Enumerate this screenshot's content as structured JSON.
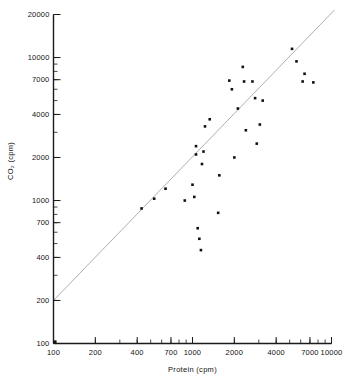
{
  "chart_data": {
    "type": "scatter",
    "title": "",
    "xlabel": "Protein (cpm)",
    "ylabel": "CO2 (cpm)",
    "ylabel_display": "CO₂ (cpm)",
    "xscale": "log",
    "yscale": "log",
    "xlim": [
      100,
      10000
    ],
    "ylim": [
      100,
      20000
    ],
    "grid": false,
    "legend": null,
    "xticks": [
      100,
      200,
      400,
      700,
      1000,
      2000,
      4000,
      7000,
      10000
    ],
    "xticklabels": [
      "100",
      "200",
      "400",
      "700",
      "1000",
      "2000",
      "4000",
      "7000",
      "10000"
    ],
    "yticks": [
      100,
      200,
      400,
      700,
      1000,
      2000,
      4000,
      7000,
      10000,
      20000
    ],
    "yticklabels": [
      "100",
      "200",
      "400",
      "700",
      "1000",
      "2000",
      "4000",
      "7000",
      "10000",
      "20000"
    ],
    "marker": "square",
    "marker_color": "#111111",
    "marker_size": 2.6,
    "fit_line": {
      "kind": "regression",
      "color": "#9b9b9b",
      "width": 0.8,
      "x_start": 100,
      "y_start": 200,
      "x_end": 10500,
      "y_end": 21500
    },
    "points": [
      {
        "x": 103,
        "y": 103
      },
      {
        "x": 430,
        "y": 880
      },
      {
        "x": 530,
        "y": 1030
      },
      {
        "x": 640,
        "y": 1210
      },
      {
        "x": 880,
        "y": 1000
      },
      {
        "x": 1000,
        "y": 1290
      },
      {
        "x": 1030,
        "y": 1060
      },
      {
        "x": 1060,
        "y": 2100
      },
      {
        "x": 1060,
        "y": 2400
      },
      {
        "x": 1090,
        "y": 640
      },
      {
        "x": 1120,
        "y": 540
      },
      {
        "x": 1150,
        "y": 450
      },
      {
        "x": 1170,
        "y": 1800
      },
      {
        "x": 1200,
        "y": 2200
      },
      {
        "x": 1230,
        "y": 3300
      },
      {
        "x": 1330,
        "y": 3700
      },
      {
        "x": 1530,
        "y": 820
      },
      {
        "x": 1560,
        "y": 1500
      },
      {
        "x": 1840,
        "y": 6900
      },
      {
        "x": 1920,
        "y": 6000
      },
      {
        "x": 2000,
        "y": 2000
      },
      {
        "x": 2120,
        "y": 4400
      },
      {
        "x": 2300,
        "y": 8600
      },
      {
        "x": 2350,
        "y": 6800
      },
      {
        "x": 2420,
        "y": 3100
      },
      {
        "x": 2700,
        "y": 6800
      },
      {
        "x": 2820,
        "y": 5200
      },
      {
        "x": 2900,
        "y": 2500
      },
      {
        "x": 3050,
        "y": 3400
      },
      {
        "x": 3200,
        "y": 5000
      },
      {
        "x": 5200,
        "y": 11500
      },
      {
        "x": 5600,
        "y": 9400
      },
      {
        "x": 6200,
        "y": 6800
      },
      {
        "x": 6400,
        "y": 7700
      },
      {
        "x": 7400,
        "y": 6700
      }
    ]
  }
}
